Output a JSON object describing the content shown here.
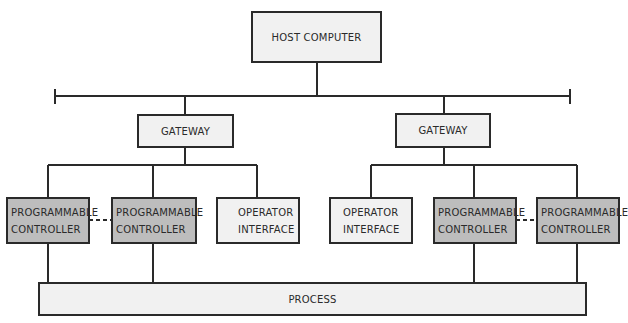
{
  "diagram": {
    "type": "network-architecture",
    "colors": {
      "line": "#2a2a2a",
      "light_fill": "#f1f1f1",
      "controller_fill": "#bdbdbd",
      "background": "#ffffff"
    },
    "nodes": {
      "host": {
        "label": "HOST COMPUTER"
      },
      "gateway_left": {
        "label": "GATEWAY"
      },
      "gateway_right": {
        "label": "GATEWAY"
      },
      "pc1": {
        "line1": "PROGRAMMABLE",
        "line2": "CONTROLLER"
      },
      "pc2": {
        "line1": "PROGRAMMABLE",
        "line2": "CONTROLLER"
      },
      "oi1": {
        "line1": "OPERATOR",
        "line2": "INTERFACE"
      },
      "oi2": {
        "line1": "OPERATOR",
        "line2": "INTERFACE"
      },
      "pc3": {
        "line1": "PROGRAMMABLE",
        "line2": "CONTROLLER"
      },
      "pc4": {
        "line1": "PROGRAMMABLE",
        "line2": "CONTROLLER"
      },
      "process": {
        "label": "PROCESS"
      }
    },
    "edges": [
      {
        "from": "host",
        "to": "bus",
        "style": "solid"
      },
      {
        "from": "bus",
        "to": "gateway_left",
        "style": "solid"
      },
      {
        "from": "bus",
        "to": "gateway_right",
        "style": "solid"
      },
      {
        "from": "gateway_left",
        "to": "pc1",
        "style": "solid"
      },
      {
        "from": "gateway_left",
        "to": "pc2",
        "style": "solid"
      },
      {
        "from": "gateway_left",
        "to": "oi1",
        "style": "solid"
      },
      {
        "from": "gateway_right",
        "to": "oi2",
        "style": "solid"
      },
      {
        "from": "gateway_right",
        "to": "pc3",
        "style": "solid"
      },
      {
        "from": "gateway_right",
        "to": "pc4",
        "style": "solid"
      },
      {
        "from": "pc1",
        "to": "pc2",
        "style": "dashed"
      },
      {
        "from": "pc3",
        "to": "pc4",
        "style": "dashed"
      },
      {
        "from": "pc1",
        "to": "process",
        "style": "solid"
      },
      {
        "from": "pc2",
        "to": "process",
        "style": "solid"
      },
      {
        "from": "pc3",
        "to": "process",
        "style": "solid"
      },
      {
        "from": "pc4",
        "to": "process",
        "style": "solid"
      }
    ]
  }
}
